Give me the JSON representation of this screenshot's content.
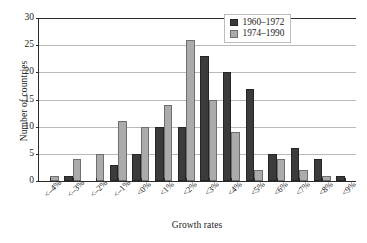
{
  "chart_data": {
    "type": "bar",
    "title": "",
    "xlabel": "Growth rates",
    "ylabel": "Number of countries",
    "ylim": [
      0,
      30
    ],
    "yticks": [
      0,
      5,
      10,
      15,
      20,
      25,
      30
    ],
    "grid": true,
    "legend_position": "top-right",
    "categories": [
      "<–4%",
      "<–3%",
      "<–2%",
      "<–1%",
      "<0%",
      "<1%",
      "<2%",
      "<3%",
      "<4%",
      "<5%",
      "<6%",
      "<7%",
      "<8%",
      "<9%"
    ],
    "series": [
      {
        "name": "1960–1972",
        "color": "#3b3b3b",
        "values": [
          0,
          1,
          0,
          3,
          5,
          10,
          10,
          23,
          20,
          17,
          5,
          6,
          4,
          1
        ]
      },
      {
        "name": "1974–1990",
        "color": "#ababab",
        "values": [
          1,
          4,
          5,
          11,
          10,
          14,
          26,
          15,
          9,
          2,
          4,
          2,
          1,
          0
        ]
      }
    ]
  },
  "legend": {
    "items": [
      {
        "label": "1960–1972"
      },
      {
        "label": "1974–1990"
      }
    ]
  }
}
